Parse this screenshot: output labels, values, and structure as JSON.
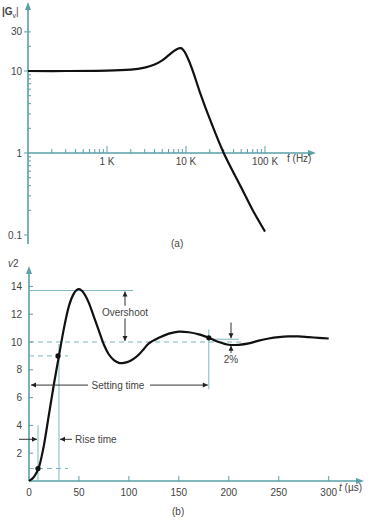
{
  "chart_data": [
    {
      "type": "line",
      "panel_label": "(a)",
      "title": "",
      "ylabel": "|G_v|",
      "ylabel_main": "|G",
      "ylabel_sub": "v",
      "ylabel_end": "|",
      "xlabel": "f (Hz)",
      "xscale": "log",
      "yscale": "log",
      "xlim": [
        100,
        200000
      ],
      "ylim": [
        0.08,
        40
      ],
      "x_ticks": [
        {
          "value": 1000,
          "label": "1 K"
        },
        {
          "value": 10000,
          "label": "10 K"
        },
        {
          "value": 100000,
          "label": "100 K"
        }
      ],
      "y_ticks": [
        {
          "value": 30,
          "label": "30"
        },
        {
          "value": 10,
          "label": "10"
        },
        {
          "value": 1,
          "label": "1"
        },
        {
          "value": 0.1,
          "label": "0.1"
        }
      ],
      "series": [
        {
          "name": "|G_v|",
          "x": [
            100,
            300,
            1000,
            2000,
            3000,
            4000,
            5000,
            6000,
            7000,
            8000,
            8500,
            9000,
            10000,
            12000,
            15000,
            20000,
            30000,
            50000,
            70000,
            100000
          ],
          "y": [
            10,
            10,
            10.1,
            10.4,
            11,
            12,
            13.5,
            15.5,
            17.5,
            18.8,
            19,
            18.5,
            16,
            10.5,
            5.5,
            2.6,
            1.0,
            0.38,
            0.2,
            0.11
          ]
        }
      ]
    },
    {
      "type": "line",
      "panel_label": "(b)",
      "title": "",
      "ylabel": "v2",
      "ylabel_main": "v",
      "ylabel_sub": "2",
      "xlabel": "t (µs)",
      "xlabel_var": "t",
      "xlabel_unit": "(µs)",
      "xlim": [
        0,
        310
      ],
      "ylim": [
        0,
        15.5
      ],
      "x_ticks": [
        0,
        50,
        100,
        150,
        200,
        250,
        300
      ],
      "y_ticks": [
        2,
        4,
        6,
        8,
        10,
        12,
        14
      ],
      "series": [
        {
          "name": "v2",
          "x": [
            0,
            5,
            10,
            15,
            20,
            25,
            30,
            35,
            40,
            45,
            50,
            55,
            60,
            65,
            70,
            75,
            80,
            85,
            90,
            95,
            100,
            105,
            110,
            115,
            120,
            130,
            140,
            150,
            160,
            170,
            180,
            190,
            200,
            210,
            220,
            230,
            240,
            250,
            260,
            270,
            280,
            290,
            300
          ],
          "y": [
            0,
            0.3,
            1.0,
            2.6,
            4.8,
            7.0,
            9.0,
            11.0,
            12.6,
            13.5,
            13.8,
            13.5,
            12.8,
            11.8,
            10.8,
            9.8,
            9.1,
            8.7,
            8.5,
            8.5,
            8.6,
            8.8,
            9.1,
            9.5,
            9.9,
            10.3,
            10.6,
            10.75,
            10.7,
            10.55,
            10.3,
            10.0,
            9.8,
            9.8,
            9.9,
            10.1,
            10.25,
            10.35,
            10.4,
            10.4,
            10.35,
            10.3,
            10.25
          ]
        }
      ],
      "markers": [
        {
          "name": "10-percent-point",
          "x": 9,
          "y": 0.9
        },
        {
          "name": "90-percent-point",
          "x": 29,
          "y": 9.0
        },
        {
          "name": "settling-point",
          "x": 180,
          "y": 10.3
        }
      ],
      "reference_lines": {
        "final_value": 10,
        "peak_value": 13.7,
        "ten_percent": 0.9,
        "ninety_percent": 9.0,
        "rise_start_t": 9,
        "rise_end_t": 30,
        "settling_t": 180
      },
      "annotations": [
        {
          "name": "overshoot",
          "text": "Overshoot"
        },
        {
          "name": "settling-time",
          "text": "Setting time"
        },
        {
          "name": "rise-time",
          "text": "Rise time"
        },
        {
          "name": "tolerance-band",
          "text": "2%"
        }
      ]
    }
  ]
}
